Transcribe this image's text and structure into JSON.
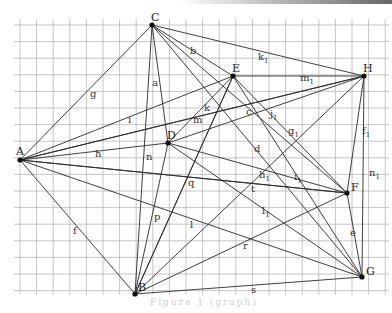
{
  "figure": {
    "caption": "Figure  1  (graph)",
    "grid": {
      "x0": 20,
      "y0": 25,
      "step_x": 16.6,
      "step_y": 16.6,
      "cols": 22,
      "rows": 16
    },
    "vertices": [
      {
        "id": "A",
        "x": 20,
        "y": 160
      },
      {
        "id": "B",
        "x": 135,
        "y": 294
      },
      {
        "id": "C",
        "x": 152,
        "y": 25
      },
      {
        "id": "D",
        "x": 168,
        "y": 143
      },
      {
        "id": "E",
        "x": 233,
        "y": 76
      },
      {
        "id": "F",
        "x": 347,
        "y": 193
      },
      {
        "id": "G",
        "x": 362,
        "y": 277
      },
      {
        "id": "H",
        "x": 364,
        "y": 76
      }
    ],
    "edges": [
      {
        "label": "g",
        "from": "A",
        "to": "C",
        "lx": 90,
        "ly": 97
      },
      {
        "label": "i",
        "from": "A",
        "to": "H",
        "lx": 128,
        "ly": 123
      },
      {
        "label": "h",
        "from": "A",
        "to": "D",
        "lx": 95,
        "ly": 157
      },
      {
        "label": "f",
        "from": "A",
        "to": "B",
        "lx": 73,
        "ly": 234
      },
      {
        "label": "",
        "from": "A",
        "to": "E",
        "lx": 0,
        "ly": 0
      },
      {
        "label": "",
        "from": "A",
        "to": "F",
        "lx": 0,
        "ly": 0
      },
      {
        "label": "l",
        "from": "A",
        "to": "G",
        "lx": 190,
        "ly": 228
      },
      {
        "label": "a",
        "from": "C",
        "to": "D",
        "lx": 152,
        "ly": 86
      },
      {
        "label": "n",
        "from": "C",
        "to": "B",
        "lx": 146,
        "ly": 160
      },
      {
        "label": "b",
        "from": "C",
        "to": "F",
        "lx": 190,
        "ly": 54
      },
      {
        "label": "k1",
        "from": "C",
        "to": "H",
        "lx": 258,
        "ly": 60
      },
      {
        "label": "",
        "from": "C",
        "to": "E",
        "lx": 0,
        "ly": 0
      },
      {
        "label": "d",
        "from": "C",
        "to": "G",
        "lx": 254,
        "ly": 152
      },
      {
        "label": "m",
        "from": "D",
        "to": "E",
        "lx": 193,
        "ly": 123
      },
      {
        "label": "k",
        "from": "D",
        "to": "H",
        "lx": 204,
        "ly": 111
      },
      {
        "label": "h1",
        "from": "D",
        "to": "F",
        "lx": 259,
        "ly": 178
      },
      {
        "label": "l1",
        "from": "D",
        "to": "G",
        "lx": 262,
        "ly": 214
      },
      {
        "label": "m1",
        "from": "E",
        "to": "H",
        "lx": 300,
        "ly": 81
      },
      {
        "label": "q",
        "from": "E",
        "to": "B",
        "lx": 188,
        "ly": 186
      },
      {
        "label": "g1",
        "from": "E",
        "to": "G",
        "lx": 288,
        "ly": 134
      },
      {
        "label": "j1",
        "from": "E",
        "to": "F",
        "lx": 270,
        "ly": 117
      },
      {
        "label": "c",
        "from": "A",
        "to": "H",
        "lx": 246,
        "ly": 115
      },
      {
        "label": "f1",
        "from": "H",
        "to": "F",
        "lx": 362,
        "ly": 134
      },
      {
        "label": "n1",
        "from": "H",
        "to": "G",
        "lx": 369,
        "ly": 176
      },
      {
        "label": "e",
        "from": "F",
        "to": "G",
        "lx": 350,
        "ly": 236
      },
      {
        "label": "p",
        "from": "B",
        "to": "D",
        "lx": 154,
        "ly": 220
      },
      {
        "label": "t",
        "from": "B",
        "to": "H",
        "lx": 251,
        "ly": 192
      },
      {
        "label": "r",
        "from": "B",
        "to": "F",
        "lx": 243,
        "ly": 249
      },
      {
        "label": "s",
        "from": "B",
        "to": "G",
        "lx": 251,
        "ly": 293
      },
      {
        "label": "",
        "from": "B",
        "to": "E",
        "lx": 0,
        "ly": 0
      },
      {
        "label": "i1",
        "from": "A",
        "to": "F",
        "lx": 294,
        "ly": 180
      }
    ]
  }
}
